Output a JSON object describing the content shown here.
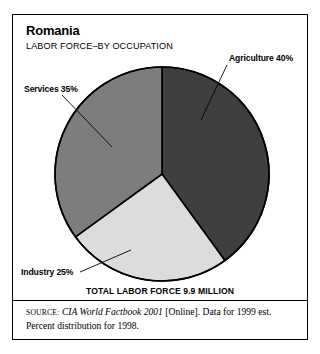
{
  "header": {
    "title": "Romania",
    "subtitle": "LABOR FORCE–BY OCCUPATION"
  },
  "labels": {
    "agriculture": "Agriculture 40%",
    "services": "Services 35%",
    "industry": "Industry 25%"
  },
  "total_caption": "TOTAL LABOR FORCE 9.9 MILLION",
  "source": {
    "prefix": "SOURCE:",
    "publication": "CIA World Factbook 2001",
    "rest": " [Online]. Data for 1999 est. Percent distribution for 1998."
  },
  "colors": {
    "agriculture": "#3f3f3f",
    "industry": "#dcdcdc",
    "services": "#7d7d7d",
    "outline": "#000000",
    "frame": "#000000",
    "background": "#ffffff",
    "leader_line": "#000000"
  },
  "chart_data": {
    "type": "pie",
    "title": "Romania",
    "subtitle": "LABOR FORCE–BY OCCUPATION",
    "categories": [
      "Agriculture",
      "Industry",
      "Services"
    ],
    "values": [
      40,
      25,
      35
    ],
    "value_unit": "%",
    "labels": [
      "Agriculture 40%",
      "Industry 25%",
      "Services 35%"
    ],
    "slice_colors": [
      "#3f3f3f",
      "#dcdcdc",
      "#7d7d7d"
    ],
    "start_angle_deg": 0,
    "direction": "clockwise",
    "total_label": "TOTAL LABOR FORCE 9.9 MILLION",
    "total_value": 9.9,
    "total_unit": "million",
    "legend": "none",
    "annotations": [
      "SOURCE: CIA World Factbook 2001 [Online]. Data for 1999 est. Percent distribution for 1998."
    ]
  }
}
